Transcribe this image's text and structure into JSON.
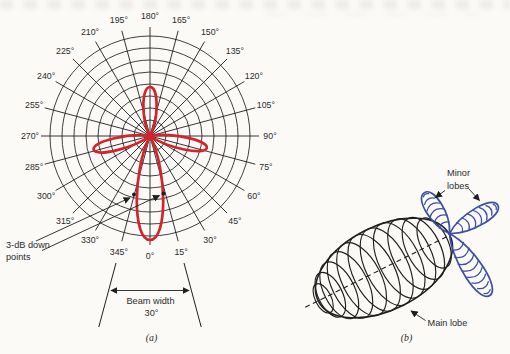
{
  "figure": {
    "panel_a": {
      "caption": "(a)",
      "angle_labels": [
        "0°",
        "15°",
        "30°",
        "45°",
        "60°",
        "75°",
        "90°",
        "105°",
        "120°",
        "135°",
        "150°",
        "165°",
        "180°",
        "195°",
        "210°",
        "225°",
        "240°",
        "255°",
        "270°",
        "285°",
        "300°",
        "315°",
        "330°",
        "345°"
      ],
      "annotations": {
        "three_db_line1": "3-dB down",
        "three_db_line2": "points",
        "beam_width_label": "Beam width",
        "beam_width_value": "30°"
      }
    },
    "panel_b": {
      "caption": "(b)",
      "minor_lobes_line1": "Minor",
      "minor_lobes_line2": "lobes",
      "main_lobe_label": "Main lobe"
    },
    "colors": {
      "pattern_red": "#d6232a",
      "minor_lobe_blue": "#3c4fa2",
      "line_black": "#1f1f1f",
      "text": "#2b2b2b",
      "paper": "#fbfaf7"
    }
  }
}
